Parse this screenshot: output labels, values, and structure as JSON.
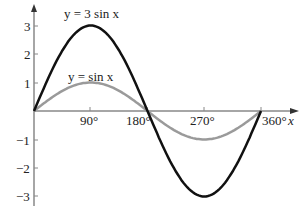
{
  "chart_data": {
    "type": "line",
    "title": "",
    "xlabel": "x",
    "ylabel": "",
    "x_tick_labels": [
      "90°",
      "180°",
      "270°",
      "360°"
    ],
    "x_ticks": [
      90,
      180,
      270,
      360
    ],
    "y_ticks": [
      3,
      2,
      1,
      -1,
      -2,
      -3
    ],
    "y_tick_labels": [
      "3",
      "2",
      "1",
      "−1",
      "−2",
      "−3"
    ],
    "xlim": [
      0,
      360
    ],
    "ylim": [
      -3,
      3
    ],
    "grid": false,
    "legend": "inline annotations",
    "series": [
      {
        "name": "y = 3 sin x",
        "color": "#111111",
        "x": [
          0,
          30,
          60,
          90,
          120,
          150,
          180,
          210,
          240,
          270,
          300,
          330,
          360
        ],
        "values": [
          0,
          1.5,
          2.6,
          3,
          2.6,
          1.5,
          0,
          -1.5,
          -2.6,
          -3,
          -2.6,
          -1.5,
          0
        ]
      },
      {
        "name": "y = sin x",
        "color": "#9a9a9a",
        "x": [
          0,
          30,
          60,
          90,
          120,
          150,
          180,
          210,
          240,
          270,
          300,
          330,
          360
        ],
        "values": [
          0,
          0.5,
          0.87,
          1,
          0.87,
          0.5,
          0,
          -0.5,
          -0.87,
          -1,
          -0.87,
          -0.5,
          0
        ]
      }
    ],
    "annotations": [
      {
        "text": "y = 3 sin x",
        "near": [
          90,
          3
        ]
      },
      {
        "text": "y = sin x",
        "near": [
          90,
          1
        ]
      }
    ]
  },
  "labels": {
    "series3": "y = 3 sin x",
    "series1": "y = sin x",
    "x_axis": "x",
    "xt90": "90°",
    "xt180": "180°",
    "xt270": "270°",
    "xt360": "360°",
    "y3": "3",
    "y2": "2",
    "y1": "1",
    "ym1": "−1",
    "ym2": "−2",
    "ym3": "−3"
  }
}
